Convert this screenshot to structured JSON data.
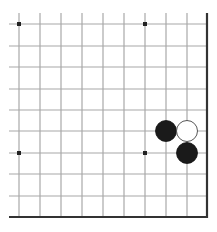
{
  "board": {
    "description": "Go board fragment (lower-right corner region)",
    "columns_x": [
      19,
      40,
      61,
      82,
      103,
      124,
      145,
      166,
      187
    ],
    "right_edge_x": 207,
    "rows_y": [
      24,
      46,
      67,
      89,
      110,
      131,
      153,
      174,
      196
    ],
    "bottom_edge_y": 217,
    "line_top_y": 13,
    "line_left_x": 9,
    "grid_color": "#a8a8a8",
    "edge_color": "#333333",
    "star_points": [
      {
        "x": 19,
        "y": 24
      },
      {
        "x": 145,
        "y": 24
      },
      {
        "x": 19,
        "y": 153
      },
      {
        "x": 145,
        "y": 153
      }
    ],
    "stones": [
      {
        "color": "black",
        "x": 166,
        "y": 131
      },
      {
        "color": "white",
        "x": 187,
        "y": 131
      },
      {
        "color": "black",
        "x": 187,
        "y": 153
      }
    ],
    "stone_radius": 10.5
  }
}
